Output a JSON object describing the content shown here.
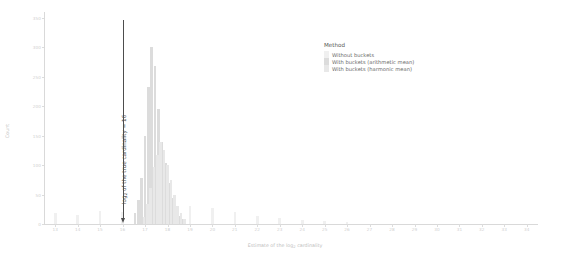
{
  "chart_data": {
    "type": "bar",
    "title": "",
    "xlabel": "Estimate of the log₂ cardinality",
    "ylabel": "Count",
    "xlim": [
      12.5,
      34.5
    ],
    "ylim": [
      0,
      360
    ],
    "grid": false,
    "xticks": [
      13,
      14,
      15,
      16,
      17,
      18,
      19,
      20,
      21,
      22,
      23,
      24,
      25,
      26,
      27,
      28,
      29,
      30,
      31,
      32,
      33,
      34
    ],
    "xtick_labels": [
      "13",
      "14",
      "15",
      "16",
      "17",
      "18",
      "19",
      "20",
      "21",
      "22",
      "23",
      "24",
      "25",
      "26",
      "27",
      "28",
      "29",
      "30",
      "31",
      "32",
      "33",
      "34"
    ],
    "yticks": [
      0,
      50,
      100,
      150,
      200,
      250,
      300,
      350
    ],
    "ytick_labels": [
      "0",
      "50",
      "100",
      "150",
      "200",
      "250",
      "300",
      "350"
    ],
    "legend": {
      "title": "Method",
      "position": "upper-right-inside",
      "entries": [
        {
          "name": "Without buckets",
          "color": "#f0f0f0"
        },
        {
          "name": "With buckets (arithmetic mean)",
          "color": "#dcdcdc"
        },
        {
          "name": "With buckets (harmonic mean)",
          "color": "#e8e8e8"
        }
      ]
    },
    "annotations": [
      {
        "name": "true-cardinality-marker",
        "text": "log₂ of the true cardinality = 16",
        "x": 16,
        "orientation": "vertical",
        "arrow": "down",
        "color": "#4d4d4d"
      }
    ],
    "series": [
      {
        "name": "Without buckets",
        "color": "#f0f0f0",
        "points": [
          {
            "x": 13.0,
            "y": 18
          },
          {
            "x": 14.0,
            "y": 16
          },
          {
            "x": 15.0,
            "y": 22
          },
          {
            "x": 16.0,
            "y": 20
          },
          {
            "x": 17.0,
            "y": 26
          },
          {
            "x": 18.0,
            "y": 24
          },
          {
            "x": 19.0,
            "y": 30
          },
          {
            "x": 20.0,
            "y": 27
          },
          {
            "x": 21.0,
            "y": 20
          },
          {
            "x": 22.0,
            "y": 14
          },
          {
            "x": 23.0,
            "y": 10
          },
          {
            "x": 24.0,
            "y": 7
          },
          {
            "x": 25.0,
            "y": 5
          },
          {
            "x": 26.0,
            "y": 4
          }
        ]
      },
      {
        "name": "With buckets (arithmetic mean)",
        "color": "#dcdcdc",
        "points": [
          {
            "x": 16.55,
            "y": 18
          },
          {
            "x": 16.7,
            "y": 40
          },
          {
            "x": 16.85,
            "y": 78
          },
          {
            "x": 17.0,
            "y": 150
          },
          {
            "x": 17.15,
            "y": 232
          },
          {
            "x": 17.3,
            "y": 300
          },
          {
            "x": 17.45,
            "y": 268
          },
          {
            "x": 17.6,
            "y": 196
          },
          {
            "x": 17.75,
            "y": 140
          },
          {
            "x": 17.9,
            "y": 104
          },
          {
            "x": 18.05,
            "y": 70
          },
          {
            "x": 18.2,
            "y": 44
          },
          {
            "x": 18.35,
            "y": 26
          },
          {
            "x": 18.5,
            "y": 14
          },
          {
            "x": 18.65,
            "y": 8
          }
        ]
      },
      {
        "name": "With buckets (harmonic mean)",
        "color": "#e8e8e8",
        "points": [
          {
            "x": 16.95,
            "y": 12
          },
          {
            "x": 17.1,
            "y": 34
          },
          {
            "x": 17.25,
            "y": 62
          },
          {
            "x": 17.4,
            "y": 96
          },
          {
            "x": 17.55,
            "y": 118
          },
          {
            "x": 17.7,
            "y": 140
          },
          {
            "x": 17.85,
            "y": 126
          },
          {
            "x": 18.0,
            "y": 100
          },
          {
            "x": 18.15,
            "y": 74
          },
          {
            "x": 18.3,
            "y": 50
          },
          {
            "x": 18.45,
            "y": 30
          },
          {
            "x": 18.6,
            "y": 18
          },
          {
            "x": 18.75,
            "y": 9
          }
        ]
      }
    ]
  }
}
